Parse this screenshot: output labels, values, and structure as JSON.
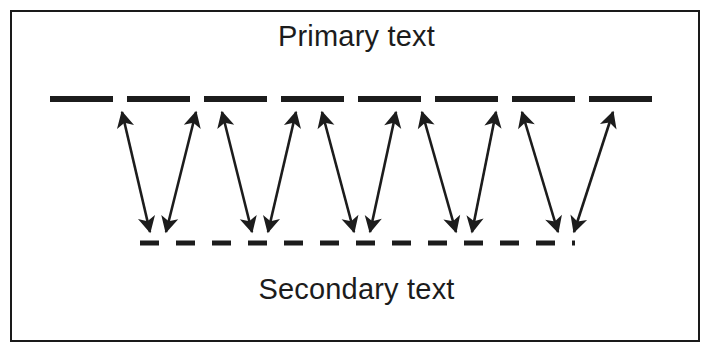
{
  "figure": {
    "title_top": "Primary text",
    "title_bottom": "Secondary text",
    "border_color": "#1a1a1a",
    "ink_color": "#1c1c1c",
    "background_color": "#ffffff"
  },
  "chart_data": {
    "type": "diagram",
    "title": "",
    "labels": {
      "top": "Primary text",
      "bottom": "Secondary text"
    },
    "lines": [
      {
        "name": "primary-line",
        "label": "Primary text",
        "y": 99,
        "x_start": 50,
        "x_end": 665,
        "style": "dashed",
        "stroke_width": 6,
        "dash_length": 63,
        "gap_length": 14,
        "color": "#1c1c1c"
      },
      {
        "name": "secondary-line",
        "label": "Secondary text",
        "y": 243,
        "x_start": 140,
        "x_end": 575,
        "style": "dashed",
        "stroke_width": 5,
        "dash_length": 19,
        "gap_length": 17,
        "color": "#1c1c1c"
      }
    ],
    "arrow_vertices_top": [
      122,
      196,
      222,
      296,
      322,
      396,
      422,
      496,
      522,
      613
    ],
    "arrow_vertices_bottom": [
      150,
      166,
      252,
      268,
      354,
      370,
      456,
      472,
      558,
      574
    ],
    "arrow_count": 10,
    "arrow_style": "double-headed",
    "v_shapes": 5,
    "v_spacing": 102,
    "grid": false,
    "legend": null
  }
}
